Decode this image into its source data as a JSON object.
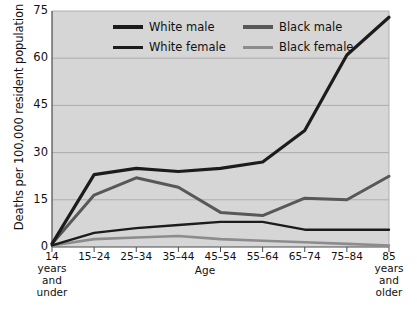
{
  "chart_data": {
    "type": "line",
    "title": "",
    "xlabel": "Age",
    "ylabel": "Deaths per 100,000 resident population",
    "ylim": [
      0,
      75
    ],
    "yticks": [
      0,
      15,
      30,
      45,
      60,
      75
    ],
    "grid": true,
    "legend_position": "top-inside",
    "categories": [
      "14 years and under",
      "15–24",
      "25–34",
      "35–44",
      "45–54",
      "55–64",
      "65–74",
      "75–84",
      "85 years and older"
    ],
    "category_lines": [
      [
        "14",
        "years",
        "and",
        "under"
      ],
      [
        "15–24"
      ],
      [
        "25–34"
      ],
      [
        "35–44"
      ],
      [
        "45–54"
      ],
      [
        "55–64"
      ],
      [
        "65–74"
      ],
      [
        "75–84"
      ],
      [
        "85",
        "years",
        "and",
        "older"
      ]
    ],
    "series": [
      {
        "name": "White male",
        "color": "#1c1c1c",
        "width": 3.2,
        "values": [
          1,
          23,
          25,
          24,
          25,
          27,
          37,
          61,
          73
        ]
      },
      {
        "name": "White female",
        "color": "#1c1c1c",
        "width": 2.4,
        "values": [
          0.5,
          4.5,
          6,
          7,
          8,
          8,
          5.5,
          5.5,
          5.5
        ]
      },
      {
        "name": "Black male",
        "color": "#585858",
        "width": 3.0,
        "values": [
          1,
          16.5,
          22,
          19,
          11,
          10,
          15.5,
          15,
          22.5
        ]
      },
      {
        "name": "Black female",
        "color": "#8c8c8c",
        "width": 2.6,
        "values": [
          0.5,
          2.5,
          3,
          3.5,
          2.5,
          2,
          1.5,
          1,
          0.5
        ]
      }
    ]
  },
  "legend": {
    "items": [
      {
        "label": "White male",
        "color": "#1c1c1c",
        "thickness": 4
      },
      {
        "label": "White female",
        "color": "#1c1c1c",
        "thickness": 3
      },
      {
        "label": "Black male",
        "color": "#585858",
        "thickness": 4
      },
      {
        "label": "Black female",
        "color": "#8c8c8c",
        "thickness": 3
      }
    ]
  },
  "axes": {
    "y_tick_labels": [
      "75",
      "60",
      "45",
      "30",
      "15",
      "0"
    ],
    "x_axis_title": "Age"
  },
  "colors": {
    "plot_background": "#d6d6d6",
    "grid": "#a8a8a8",
    "axis": "#4a4a4a",
    "text": "#111111"
  }
}
